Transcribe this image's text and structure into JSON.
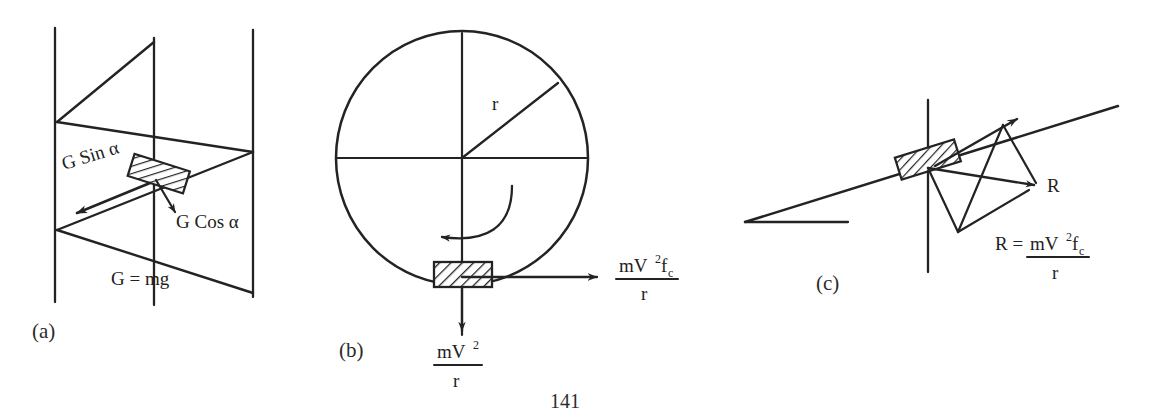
{
  "document": {
    "page_number": "141",
    "figure_type": "physics force diagrams",
    "ink_color": "#232323",
    "background_color": "#ffffff"
  },
  "panels": [
    {
      "id": "a",
      "label": "(a)",
      "description": "inclined plane with hatched block and force components",
      "labels": {
        "force_along_incline": "G Sin α",
        "force_normal": "G Cos α",
        "weight": "G = mg"
      }
    },
    {
      "id": "b",
      "label": "(b)",
      "description": "rotating circle with hatched block at bottom",
      "labels": {
        "radius": "r"
      },
      "horizontal_force": {
        "numerator": "mV",
        "numerator_sup": "2",
        "numerator_sub_var": "f",
        "numerator_sub": "c",
        "denominator": "r"
      },
      "vertical_force": {
        "numerator": "mV",
        "numerator_sup": "2",
        "denominator": "r"
      }
    },
    {
      "id": "c",
      "label": "(c)",
      "description": "inclined line with hatched block and resultant force parallelogram",
      "labels": {
        "resultant": "R",
        "equation_lhs": "R =",
        "equation_numerator": "mV",
        "equation_numerator_sup": "2",
        "equation_numerator_sub_var": "f",
        "equation_numerator_sub": "c",
        "equation_denominator": "r"
      }
    }
  ]
}
